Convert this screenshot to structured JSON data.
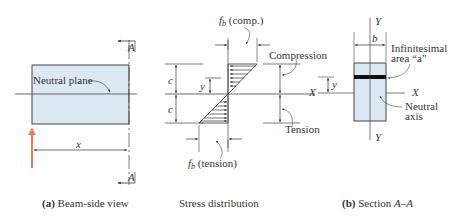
{
  "beam_view": {
    "section_marker_top": "A",
    "section_marker_bottom": "A",
    "neutral_plane_label": "Neutral plane",
    "distance_label": "x",
    "caption_prefix": "(a)",
    "caption_text": " Beam-side view"
  },
  "stress_distribution": {
    "fb_comp_label": "f",
    "fb_comp_sub": "b",
    "fb_comp_suffix": " (comp.)",
    "fb_tension_label": "f",
    "fb_tension_sub": "b",
    "fb_tension_suffix": " (tension)",
    "c_upper": "c",
    "c_lower": "c",
    "y_label": "y",
    "compression_label": "Compression",
    "tension_label": "Tension",
    "caption_text": "Stress distribution"
  },
  "section": {
    "y_axis_top": "Y",
    "y_axis_bottom": "Y",
    "x_axis_left": "X",
    "x_axis_right": "X",
    "width_label": "b",
    "y_label": "y",
    "area_label_line1": "Infinitesimal",
    "area_label_line2": "area “a”",
    "neutral_axis_line1": "Neutral",
    "neutral_axis_line2": "axis",
    "caption_prefix": "(b)",
    "caption_text": " Section ",
    "caption_section": "A–A"
  },
  "colors": {
    "beam_fill": "#dce9f5",
    "line": "#444444",
    "reaction_arrow": "#f07a55",
    "strip": "#111111"
  }
}
